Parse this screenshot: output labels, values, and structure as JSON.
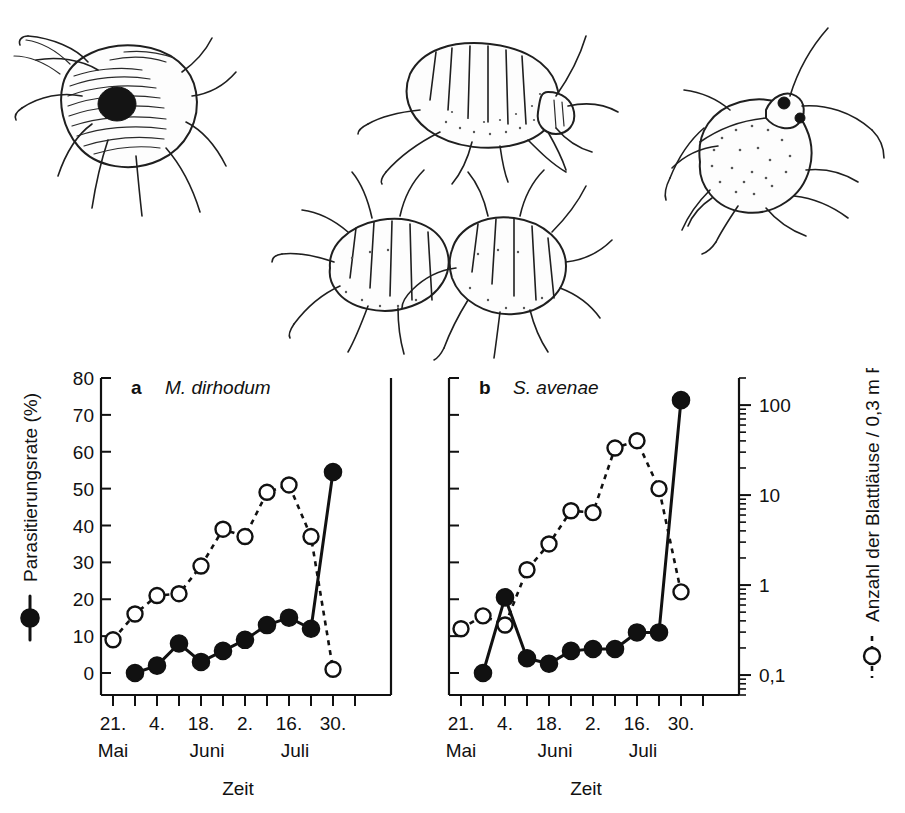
{
  "figure": {
    "caption_letters": [
      "a",
      "b"
    ],
    "illustrations": [
      {
        "name": "mummified-aphid-with-exit-hole",
        "position": "top-left"
      },
      {
        "name": "aphid-lateral-view",
        "position": "top-center"
      },
      {
        "name": "aphid-pair",
        "position": "middle-center"
      },
      {
        "name": "aphid-dorsal-view",
        "position": "top-right"
      }
    ]
  },
  "axes": {
    "left_label": "Parasitierungsrate (%)",
    "left_legend_marker": "filled-circle-solid-line",
    "right_label": "Anzahl der Blattläuse / 0,3 m Reihe",
    "right_legend_marker": "open-circle-dashed-line",
    "x_label": "Zeit",
    "left_ticks": [
      "0",
      "10",
      "20",
      "30",
      "40",
      "50",
      "60",
      "70",
      "80"
    ],
    "right_ticks": [
      "0,1",
      "1",
      "10",
      "100"
    ],
    "x_ticks": [
      "21.",
      "4.",
      "18.",
      "2.",
      "16.",
      "30."
    ],
    "x_months": [
      "Mai",
      "Juni",
      "Juli"
    ]
  },
  "chart_data": [
    {
      "type": "line",
      "panel": "a",
      "letter": "a",
      "title": "M. dirhodum",
      "xlabel": "Zeit",
      "ylabel": "Parasitierungsrate (%)",
      "y2label": "Anzahl der Blattläuse / 0,3 m Reihe",
      "ylim": [
        0,
        80
      ],
      "y2lim": [
        0.05,
        200
      ],
      "y2scale": "log",
      "grid": false,
      "legend": "axis-labels",
      "x": [
        "21. Mai",
        "28. Mai",
        "4. Juni",
        "11. Juni",
        "18. Juni",
        "25. Juni",
        "2. Juli",
        "9. Juli",
        "16. Juli",
        "23. Juli",
        "30. Juli",
        "6. Aug"
      ],
      "x_index": [
        1,
        2,
        3,
        4,
        5,
        6,
        7,
        8,
        9,
        10,
        11,
        12
      ],
      "series": [
        {
          "name": "Parasitierungsrate (%)",
          "marker": "filled-circle",
          "line": "solid",
          "axis": "left",
          "x_index": [
            2,
            3,
            4,
            5,
            6,
            7,
            8,
            9,
            10,
            11,
            12
          ],
          "values": [
            0,
            2,
            8,
            3,
            6,
            9,
            13,
            15,
            12,
            54.5,
            null
          ]
        },
        {
          "name": "Anzahl der Blattläuse / 0,3 m Reihe",
          "marker": "open-circle",
          "line": "dashed",
          "axis": "left-scaled",
          "x_index": [
            1,
            2,
            3,
            4,
            5,
            6,
            7,
            8,
            9,
            10,
            11
          ],
          "values": [
            9,
            16,
            21,
            21.5,
            29,
            39,
            37,
            49,
            51,
            37,
            1
          ]
        }
      ]
    },
    {
      "type": "line",
      "panel": "b",
      "letter": "b",
      "title": "S. avenae",
      "xlabel": "Zeit",
      "ylabel": "Parasitierungsrate (%)",
      "y2label": "Anzahl der Blattläuse / 0,3 m Reihe",
      "ylim": [
        0,
        80
      ],
      "y2lim": [
        0.05,
        200
      ],
      "y2scale": "log",
      "grid": false,
      "legend": "axis-labels",
      "x": [
        "21. Mai",
        "28. Mai",
        "4. Juni",
        "11. Juni",
        "18. Juni",
        "25. Juni",
        "2. Juli",
        "9. Juli",
        "16. Juli",
        "23. Juli",
        "30. Juli",
        "6. Aug"
      ],
      "x_index": [
        1,
        2,
        3,
        4,
        5,
        6,
        7,
        8,
        9,
        10,
        11,
        12
      ],
      "series": [
        {
          "name": "Parasitierungsrate (%)",
          "marker": "filled-circle",
          "line": "solid",
          "axis": "left",
          "x_index": [
            2,
            3,
            4,
            5,
            6,
            7,
            8,
            9,
            10,
            11,
            12
          ],
          "values": [
            0,
            20.5,
            4,
            2.5,
            6,
            6.5,
            6.5,
            11,
            11,
            74,
            null
          ]
        },
        {
          "name": "Anzahl der Blattläuse / 0,3 m Reihe",
          "marker": "open-circle",
          "line": "dashed",
          "axis": "left-scaled",
          "x_index": [
            1,
            2,
            3,
            4,
            5,
            6,
            7,
            8,
            9,
            10,
            11
          ],
          "values": [
            12,
            15.5,
            13,
            28,
            35,
            44,
            43.5,
            61,
            63,
            50,
            22
          ]
        }
      ]
    }
  ]
}
